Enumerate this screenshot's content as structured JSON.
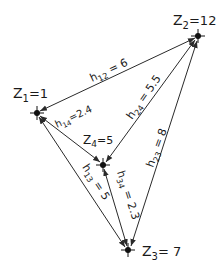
{
  "diagram": {
    "type": "network-graph",
    "nodes": [
      {
        "id": "Z1",
        "label_main": "Z",
        "label_sub": "1",
        "label_val": "=1",
        "x": 37,
        "y": 113
      },
      {
        "id": "Z2",
        "label_main": "Z",
        "label_sub": "2",
        "label_val": "=12",
        "x": 198,
        "y": 36
      },
      {
        "id": "Z3",
        "label_main": "Z",
        "label_sub": "3",
        "label_val": "= 7",
        "x": 128,
        "y": 250
      },
      {
        "id": "Z4",
        "label_main": "Z",
        "label_sub": "4",
        "label_val": "=5",
        "x": 103,
        "y": 165
      }
    ],
    "edges": [
      {
        "id": "h12",
        "from": "Z2",
        "to": "Z1",
        "label_main": "h",
        "label_sub": "12",
        "label_val": " = 6"
      },
      {
        "id": "h14",
        "from": "Z4",
        "to": "Z1",
        "label_main": "h",
        "label_sub": "14",
        "label_val": "=2.4"
      },
      {
        "id": "h24",
        "from": "Z4",
        "to": "Z2",
        "label_main": "h",
        "label_sub": "24",
        "label_val": " = 5.5"
      },
      {
        "id": "h23",
        "from": "Z3",
        "to": "Z2",
        "label_main": "h",
        "label_sub": "23",
        "label_val": " = 8"
      },
      {
        "id": "h13",
        "from": "Z1",
        "to": "Z3",
        "label_main": "h",
        "label_sub": "13",
        "label_val": " = 5"
      },
      {
        "id": "h34",
        "from": "Z4",
        "to": "Z3",
        "label_main": "h",
        "label_sub": "34",
        "label_val": " = 2.3"
      }
    ]
  }
}
